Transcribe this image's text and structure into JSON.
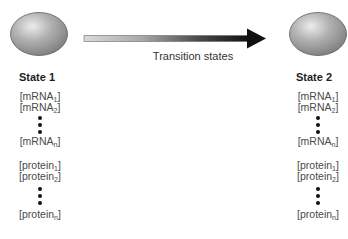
{
  "diagram": {
    "arrow": {
      "label": "Transition states",
      "gradient_start": "#d8d8d8",
      "gradient_end": "#111111"
    },
    "states": [
      {
        "title": "State 1",
        "mrna": [
          {
            "base": "[mRNA",
            "sub": "1",
            "close": "]"
          },
          {
            "base": "[mRNA",
            "sub": "2",
            "close": "]"
          },
          {
            "base": "[mRNA",
            "sub": "n",
            "close": "]"
          }
        ],
        "protein": [
          {
            "base": "[protein",
            "sub": "1",
            "close": "]"
          },
          {
            "base": "[protein",
            "sub": "2",
            "close": "]"
          },
          {
            "base": "[protein",
            "sub": "n",
            "close": "]"
          }
        ]
      },
      {
        "title": "State 2",
        "mrna": [
          {
            "base": "[mRNA",
            "sub": "1",
            "close": "]"
          },
          {
            "base": "[mRNA",
            "sub": "2",
            "close": "]"
          },
          {
            "base": "[mRNA",
            "sub": "n",
            "close": "]"
          }
        ],
        "protein": [
          {
            "base": "[protein",
            "sub": "1",
            "close": "]"
          },
          {
            "base": "[protein",
            "sub": "2",
            "close": "]"
          },
          {
            "base": "[protein",
            "sub": "n",
            "close": "]"
          }
        ]
      }
    ],
    "ellipse_colors": {
      "highlight": "#e6e6e6",
      "mid": "#a8a8a8",
      "edge": "#6e6e6e"
    }
  }
}
